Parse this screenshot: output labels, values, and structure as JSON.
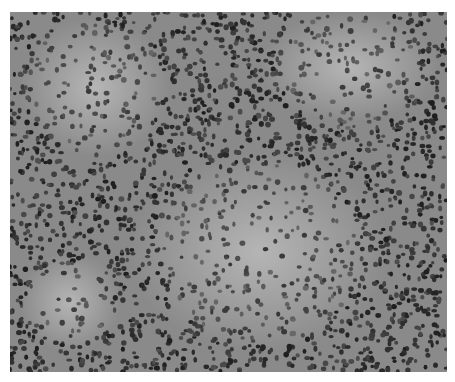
{
  "image": {
    "alt": "Grayscale histology micrograph of densely packed round cell nuclei with paler follicle-like regions",
    "subject": "tissue section micrograph",
    "colors": {
      "background": "#8c8c8c",
      "nuclei": "#2e2e2e",
      "pale_region": "#b4b4b4",
      "page": "#ffffff"
    }
  }
}
